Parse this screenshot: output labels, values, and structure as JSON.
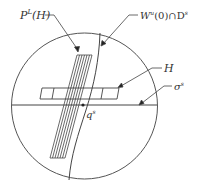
{
  "diagram": {
    "labels": {
      "fiber_bundle": "P",
      "fiber_bundle_sup": "L",
      "fiber_bundle_arg": "(H)",
      "unstable_manifold": "W",
      "unstable_manifold_sup": "u",
      "unstable_manifold_rest": "(0)∩D",
      "unstable_manifold_sup2": "s",
      "box": "H",
      "section": "σ",
      "section_sup": "s",
      "point": "q",
      "point_sup": "s"
    },
    "colors": {
      "stroke": "#444444",
      "text": "#333333"
    }
  }
}
